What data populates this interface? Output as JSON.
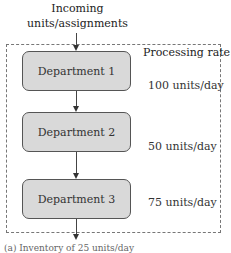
{
  "diagram": {
    "input_label_line1": "Incoming",
    "input_label_line2": "units/assignments",
    "rate_header": "Processing rate",
    "departments": [
      {
        "name": "Department 1",
        "rate": "100 units/day"
      },
      {
        "name": "Department 2",
        "rate": "50 units/day"
      },
      {
        "name": "Department 3",
        "rate": "75 units/day"
      }
    ],
    "caption_partial": "(a) Inventory of 25 units/day"
  }
}
